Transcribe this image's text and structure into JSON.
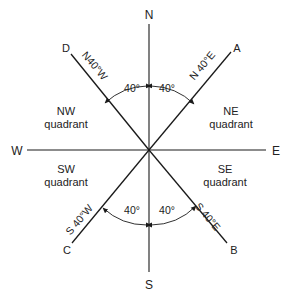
{
  "diagram": {
    "cardinals": {
      "north": "N",
      "south": "S",
      "east": "E",
      "west": "W"
    },
    "points": {
      "A": "A",
      "B": "B",
      "C": "C",
      "D": "D"
    },
    "bearings": {
      "A": "N 40°E",
      "B": "S 40°E",
      "C": "S 40°W",
      "D": "N40°W"
    },
    "angles": {
      "ne": "40°",
      "nw": "40°",
      "se": "40°",
      "sw": "40°"
    },
    "quadrants": {
      "nw": {
        "line1": "NW",
        "line2": "quadrant"
      },
      "ne": {
        "line1": "NE",
        "line2": "quadrant"
      },
      "sw": {
        "line1": "SW",
        "line2": "quadrant"
      },
      "se": {
        "line1": "SE",
        "line2": "quadrant"
      }
    },
    "colors": {
      "ink": "#1a1a1a",
      "background": "#ffffff"
    }
  }
}
